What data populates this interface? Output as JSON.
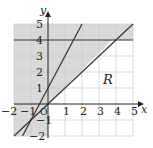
{
  "diagram": {
    "type": "inequality-region-graph",
    "axes": {
      "x_label": "x",
      "y_label": "y",
      "x_ticks": [
        "−2",
        "−1",
        "0",
        "1",
        "2",
        "3",
        "4",
        "5"
      ],
      "y_ticks": [
        "−2",
        "−1",
        "1",
        "2",
        "3",
        "4",
        "5"
      ],
      "origin_label": "O",
      "xlim": [
        -2,
        5
      ],
      "ylim": [
        -2,
        5
      ]
    },
    "lines": [
      {
        "name": "horizontal",
        "equation": "y = 4"
      },
      {
        "name": "diagonal",
        "equation": "y = x"
      },
      {
        "name": "steep",
        "equation": "y = 2x + 1"
      }
    ],
    "region_label": "R",
    "colors": {
      "shade": "#d9d9d9",
      "grid": "#c8c8c8",
      "line": "#333333",
      "axis": "#222222"
    }
  }
}
